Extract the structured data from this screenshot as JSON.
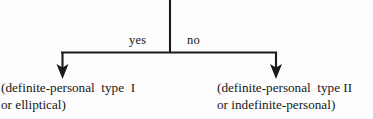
{
  "diagram": {
    "type": "decision-flowchart",
    "background_color": "#fdfdfd",
    "line_color": "#1a1a1a",
    "text_color": "#161616",
    "edges": {
      "yes_label": "yes",
      "no_label": "no"
    },
    "outcomes": {
      "left": {
        "line1": "(definite-personal  type  I",
        "line2": "or elliptical)"
      },
      "right": {
        "line1": "(definite-personal  type II",
        "line2": "or indefinite-personal)"
      }
    },
    "geometry": {
      "stem_x": 170,
      "stem_top_y": 0,
      "junction_y": 52,
      "bar_left_x": 62,
      "bar_right_x": 276,
      "arrow_tip_y": 78
    }
  }
}
